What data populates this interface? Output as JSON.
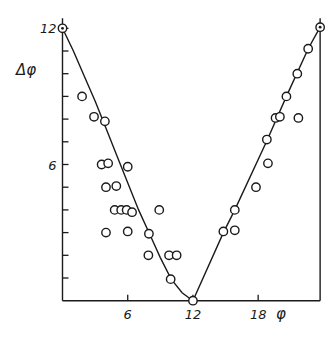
{
  "chart_data": {
    "type": "scatter",
    "title": "",
    "xlabel": "φ",
    "ylabel": "Δφ",
    "xlim": [
      0,
      23.7
    ],
    "ylim": [
      0,
      12
    ],
    "x_ticks": [
      6,
      12,
      18
    ],
    "x_tick_labels": [
      "6",
      "12",
      "18"
    ],
    "x_minor_ticks": [],
    "y_ticks": [
      1,
      2,
      3,
      4,
      5,
      6,
      7,
      8,
      9,
      10,
      11,
      12
    ],
    "y_tick_labels": [
      {
        "value": 6,
        "label": "6"
      },
      {
        "value": 12,
        "label": "12"
      }
    ],
    "grid": false,
    "legend": null,
    "colors": {
      "ink": "#1a1a1a",
      "background": "#ffffff"
    },
    "series": [
      {
        "name": "measured",
        "marker": "open-circle",
        "points": [
          {
            "x": 1.8,
            "y": 9.0
          },
          {
            "x": 2.9,
            "y": 8.1
          },
          {
            "x": 3.9,
            "y": 7.9
          },
          {
            "x": 3.6,
            "y": 6.0
          },
          {
            "x": 4.2,
            "y": 6.05
          },
          {
            "x": 6.0,
            "y": 5.9
          },
          {
            "x": 4.0,
            "y": 5.0
          },
          {
            "x": 4.95,
            "y": 5.05
          },
          {
            "x": 4.8,
            "y": 4.0
          },
          {
            "x": 5.4,
            "y": 4.0
          },
          {
            "x": 5.9,
            "y": 4.0
          },
          {
            "x": 6.4,
            "y": 3.9
          },
          {
            "x": 8.9,
            "y": 4.0
          },
          {
            "x": 4.0,
            "y": 3.0
          },
          {
            "x": 6.0,
            "y": 3.05
          },
          {
            "x": 7.95,
            "y": 2.95
          },
          {
            "x": 7.9,
            "y": 2.0
          },
          {
            "x": 9.8,
            "y": 2.0
          },
          {
            "x": 10.5,
            "y": 2.0
          },
          {
            "x": 9.95,
            "y": 0.95
          },
          {
            "x": 12.0,
            "y": 0.0
          },
          {
            "x": 14.8,
            "y": 3.05
          },
          {
            "x": 15.85,
            "y": 3.1
          },
          {
            "x": 15.85,
            "y": 4.0
          },
          {
            "x": 17.8,
            "y": 5.0
          },
          {
            "x": 18.9,
            "y": 6.05
          },
          {
            "x": 18.8,
            "y": 7.1
          },
          {
            "x": 19.6,
            "y": 8.05
          },
          {
            "x": 20.0,
            "y": 8.1
          },
          {
            "x": 21.7,
            "y": 8.05
          },
          {
            "x": 20.6,
            "y": 9.0
          },
          {
            "x": 21.6,
            "y": 10.0
          },
          {
            "x": 22.6,
            "y": 11.1
          }
        ]
      },
      {
        "name": "reference",
        "marker": "dotted-circle",
        "points": [
          {
            "x": 0.0,
            "y": 12.0
          },
          {
            "x": 23.7,
            "y": 12.05
          }
        ]
      },
      {
        "name": "fit-left",
        "type": "line",
        "points": [
          {
            "x": 0.0,
            "y": 12.0
          },
          {
            "x": 1.0,
            "y": 11.0
          },
          {
            "x": 2.0,
            "y": 9.9
          },
          {
            "x": 3.0,
            "y": 8.8
          },
          {
            "x": 4.0,
            "y": 7.6
          },
          {
            "x": 5.0,
            "y": 6.4
          },
          {
            "x": 6.0,
            "y": 5.2
          },
          {
            "x": 7.0,
            "y": 4.0
          },
          {
            "x": 8.0,
            "y": 2.95
          },
          {
            "x": 9.0,
            "y": 1.9
          },
          {
            "x": 10.0,
            "y": 0.95
          },
          {
            "x": 11.0,
            "y": 0.35
          },
          {
            "x": 12.0,
            "y": 0.0
          }
        ]
      },
      {
        "name": "fit-right",
        "type": "line",
        "points": [
          {
            "x": 12.0,
            "y": 0.0
          },
          {
            "x": 14.8,
            "y": 3.0
          },
          {
            "x": 15.85,
            "y": 4.0
          },
          {
            "x": 18.8,
            "y": 7.05
          },
          {
            "x": 20.6,
            "y": 9.0
          },
          {
            "x": 22.6,
            "y": 11.1
          },
          {
            "x": 23.7,
            "y": 12.05
          }
        ]
      }
    ]
  }
}
